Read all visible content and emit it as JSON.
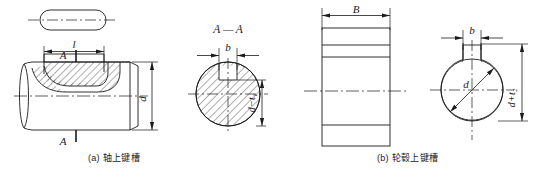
{
  "figure": {
    "title": "",
    "width": 541,
    "height": 173,
    "line_color": "#1a1a1a",
    "hatch_color": "#3a3a3a",
    "background": "#ffffff"
  },
  "captions": {
    "a": "(a) 轴上键槽",
    "b": "(b) 轮毂上键槽"
  },
  "views": {
    "key_top_view": {
      "name": "key-plan-view",
      "dimension_label": "l"
    },
    "shaft_elevation": {
      "name": "shaft-elevation-view",
      "length_label": "l",
      "diameter_label": "d",
      "section_mark_top": "A",
      "section_mark_bottom": "A"
    },
    "shaft_section": {
      "name": "shaft-section-view",
      "title": "A — A",
      "width_label": "b",
      "depth_label": "d−t₁"
    },
    "hub_elevation": {
      "name": "hub-elevation-view",
      "width_label": "B"
    },
    "hub_section": {
      "name": "hub-section-view",
      "width_label": "b",
      "diameter_label": "d",
      "depth_label": "d+t₂"
    }
  },
  "symbols": {
    "section_title_a_a": "A — A",
    "length": "l",
    "width": "b",
    "hub_width": "B",
    "diameter": "d",
    "shaft_depth": "d−t₁",
    "hub_depth": "d+t₂"
  }
}
